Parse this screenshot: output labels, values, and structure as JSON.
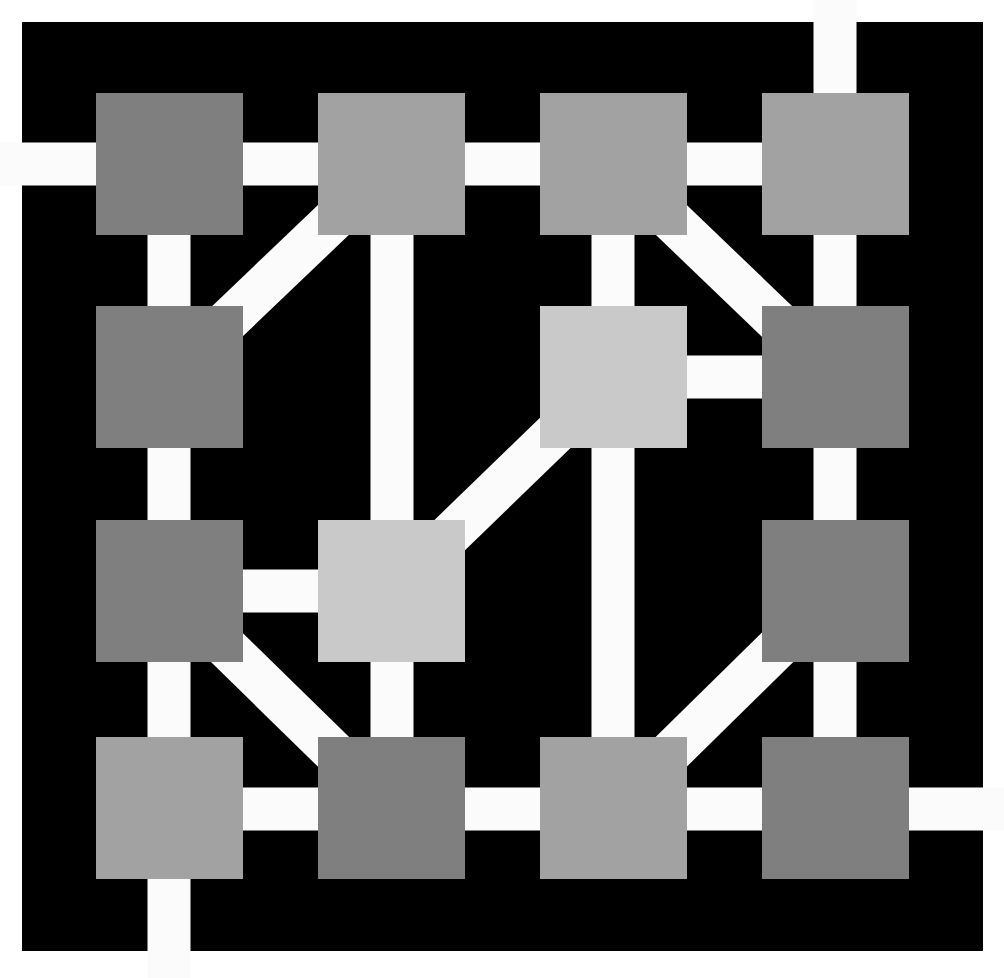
{
  "diagram": {
    "title": "",
    "background": "#ffffff",
    "frame": {
      "color": "#000000",
      "x": 22,
      "y": 22,
      "width": 961,
      "height": 929
    },
    "line_color": "#fbfbfb",
    "line_width": 43,
    "colors": {
      "dark": "#7f7f7f",
      "medium": "#a2a2a2",
      "light": "#c9c9c9"
    },
    "columns": [
      {
        "x": 96,
        "cx": 169
      },
      {
        "x": 318,
        "cx": 392
      },
      {
        "x": 540,
        "cx": 613
      },
      {
        "x": 762,
        "cx": 835
      }
    ],
    "rows": [
      {
        "y": 93,
        "cy": 164
      },
      {
        "y": 306,
        "cy": 377
      },
      {
        "y": 520,
        "cy": 591
      },
      {
        "y": 737,
        "cy": 809
      }
    ],
    "node_size": {
      "w": 147,
      "h": 142
    },
    "nodes": [
      {
        "id": "n11",
        "row": 0,
        "col": 0,
        "shade": "dark"
      },
      {
        "id": "n12",
        "row": 0,
        "col": 1,
        "shade": "medium"
      },
      {
        "id": "n13",
        "row": 0,
        "col": 2,
        "shade": "medium"
      },
      {
        "id": "n14",
        "row": 0,
        "col": 3,
        "shade": "medium"
      },
      {
        "id": "n21",
        "row": 1,
        "col": 0,
        "shade": "dark"
      },
      {
        "id": "n23",
        "row": 1,
        "col": 2,
        "shade": "light"
      },
      {
        "id": "n24",
        "row": 1,
        "col": 3,
        "shade": "dark"
      },
      {
        "id": "n31",
        "row": 2,
        "col": 0,
        "shade": "dark"
      },
      {
        "id": "n32",
        "row": 2,
        "col": 1,
        "shade": "light"
      },
      {
        "id": "n34",
        "row": 2,
        "col": 3,
        "shade": "dark"
      },
      {
        "id": "n41",
        "row": 3,
        "col": 0,
        "shade": "medium"
      },
      {
        "id": "n42",
        "row": 3,
        "col": 1,
        "shade": "dark"
      },
      {
        "id": "n43",
        "row": 3,
        "col": 2,
        "shade": "medium"
      },
      {
        "id": "n44",
        "row": 3,
        "col": 3,
        "shade": "dark"
      }
    ],
    "edges": [
      {
        "from": [
          0,
          164
        ],
        "to": [
          835,
          164
        ],
        "type": "row-1-horizontal-exit-left"
      },
      {
        "from": [
          169,
          809
        ],
        "to": [
          1004,
          809
        ],
        "type": "row-4-horizontal-exit-right"
      },
      {
        "from": [
          169,
          164
        ],
        "to": [
          169,
          978
        ],
        "type": "col-1-vertical-exit-bottom"
      },
      {
        "from": [
          835,
          0
        ],
        "to": [
          835,
          809
        ],
        "type": "col-4-vertical-exit-top"
      },
      {
        "from": [
          392,
          164
        ],
        "to": [
          392,
          809
        ],
        "type": "col-2-vertical"
      },
      {
        "from": [
          613,
          164
        ],
        "to": [
          613,
          809
        ],
        "type": "col-3-vertical"
      },
      {
        "from": [
          613,
          377
        ],
        "to": [
          835,
          377
        ],
        "type": "n23-n24"
      },
      {
        "from": [
          169,
          591
        ],
        "to": [
          392,
          591
        ],
        "type": "n31-n32"
      },
      {
        "from": [
          169,
          377
        ],
        "to": [
          392,
          164
        ],
        "type": "diag-n21-n12"
      },
      {
        "from": [
          613,
          164
        ],
        "to": [
          835,
          377
        ],
        "type": "diag-n13-n24"
      },
      {
        "from": [
          392,
          591
        ],
        "to": [
          613,
          377
        ],
        "type": "diag-n32-n23"
      },
      {
        "from": [
          169,
          591
        ],
        "to": [
          392,
          809
        ],
        "type": "diag-n31-n42"
      },
      {
        "from": [
          613,
          809
        ],
        "to": [
          835,
          591
        ],
        "type": "diag-n43-n34"
      }
    ]
  }
}
